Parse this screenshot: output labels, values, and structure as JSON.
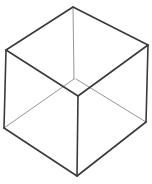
{
  "figure": {
    "stroke_dark": "#3a3a3a",
    "stroke_light": "#8a8a8a",
    "background": "#ffffff",
    "vertices": {
      "top": [
        73,
        7
      ],
      "upper_left": [
        6,
        50
      ],
      "upper_right": [
        148,
        45
      ],
      "inner": [
        75,
        79
      ],
      "front": [
        78,
        96
      ],
      "lower_left": [
        4,
        128
      ],
      "lower_right": [
        146,
        122
      ],
      "bottom": [
        77,
        176
      ]
    }
  }
}
